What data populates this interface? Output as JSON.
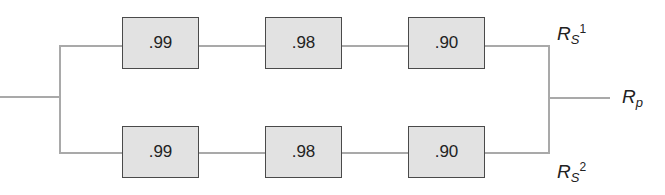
{
  "diagram": {
    "type": "reliability block diagram (parallel of two series branches)",
    "branches": [
      {
        "name": "top-branch",
        "components": [
          {
            "reliability": ".99"
          },
          {
            "reliability": ".98"
          },
          {
            "reliability": ".90"
          }
        ],
        "label": {
          "base": "R",
          "sub": "S",
          "sup": "1"
        }
      },
      {
        "name": "bottom-branch",
        "components": [
          {
            "reliability": ".99"
          },
          {
            "reliability": ".98"
          },
          {
            "reliability": ".90"
          }
        ],
        "label": {
          "base": "R",
          "sub": "S",
          "sup": "2"
        }
      }
    ],
    "output_label": {
      "base": "R",
      "sub": "p"
    },
    "colors": {
      "wire": "#a9a9a9",
      "box_fill": "#e2e2e2",
      "box_border": "#4a4a4a"
    }
  }
}
